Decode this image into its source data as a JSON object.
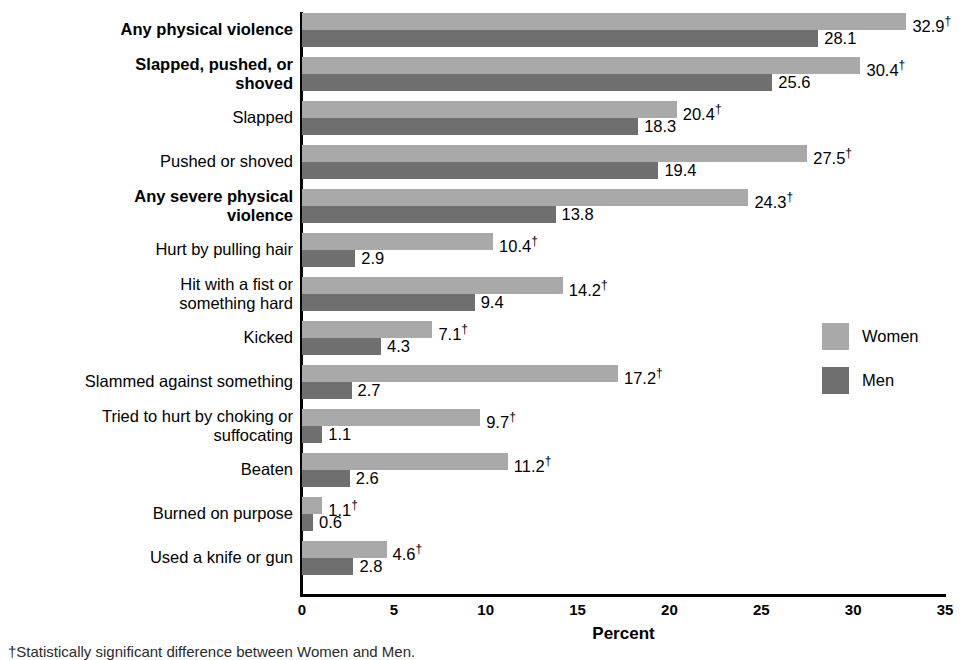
{
  "chart_data": {
    "type": "bar",
    "orientation": "horizontal",
    "title": "",
    "xlabel": "Percent",
    "ylabel": "",
    "xlim": [
      0,
      35
    ],
    "xticks": [
      0,
      5,
      10,
      15,
      20,
      25,
      30,
      35
    ],
    "grid": false,
    "legend_position": "right",
    "categories": [
      "Any physical violence",
      "Slapped, pushed, or\nshoved",
      "Slapped",
      "Pushed or shoved",
      "Any severe physical\nviolence",
      "Hurt by pulling hair",
      "Hit with a fist or\nsomething hard",
      "Kicked",
      "Slammed against something",
      "Tried to hurt by choking or\nsuffocating",
      "Beaten",
      "Burned on purpose",
      "Used a knife or gun"
    ],
    "category_bold": [
      true,
      true,
      false,
      false,
      true,
      false,
      false,
      false,
      false,
      false,
      false,
      false,
      false
    ],
    "series": [
      {
        "name": "Women",
        "color": "#a9a9a9",
        "values": [
          32.9,
          30.4,
          20.4,
          27.5,
          24.3,
          10.4,
          14.2,
          7.1,
          17.2,
          9.7,
          11.2,
          1.1,
          4.6
        ],
        "labels": [
          "32.9",
          "30.4",
          "20.4",
          "27.5",
          "24.3",
          "10.4",
          "14.2",
          "7.1",
          "17.2",
          "9.7",
          "11.2",
          "1.1",
          "4.6"
        ],
        "significant": [
          true,
          true,
          true,
          true,
          true,
          true,
          true,
          true,
          true,
          true,
          true,
          true,
          true
        ]
      },
      {
        "name": "Men",
        "color": "#6f6f6f",
        "values": [
          28.1,
          25.6,
          18.3,
          19.4,
          13.8,
          2.9,
          9.4,
          4.3,
          2.7,
          1.1,
          2.6,
          0.6,
          2.8
        ],
        "labels": [
          "28.1",
          "25.6",
          "18.3",
          "19.4",
          "13.8",
          "2.9",
          "9.4",
          "4.3",
          "2.7",
          "1.1",
          "2.6",
          "0.6",
          "2.8"
        ],
        "significant": [
          false,
          false,
          false,
          false,
          false,
          false,
          false,
          false,
          false,
          false,
          false,
          false,
          false
        ]
      }
    ],
    "significance_marker": "†"
  },
  "legend": {
    "items": [
      {
        "label": "Women",
        "color": "#a9a9a9"
      },
      {
        "label": "Men",
        "color": "#6f6f6f"
      }
    ]
  },
  "axis": {
    "x_title": "Percent",
    "tick_labels": [
      "0",
      "5",
      "10",
      "15",
      "20",
      "25",
      "30",
      "35"
    ]
  },
  "footnote": {
    "text": "†Statistically significant difference between Women and Men."
  }
}
